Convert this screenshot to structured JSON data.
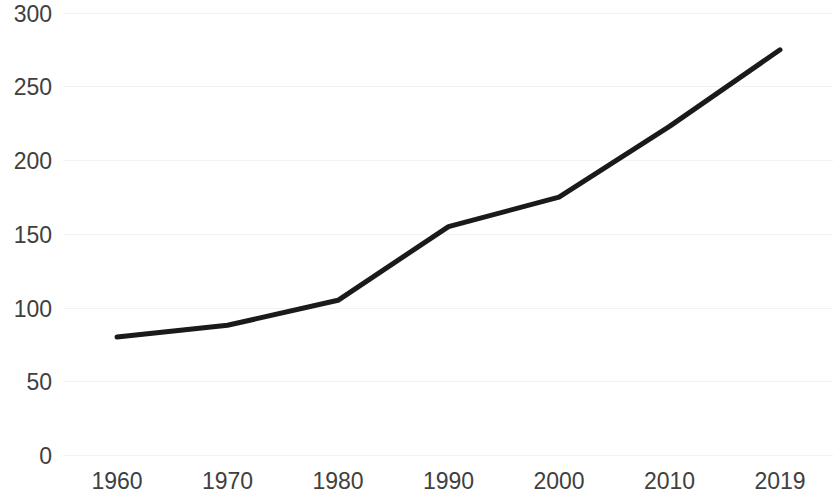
{
  "chart_data": {
    "type": "line",
    "title": "",
    "subtitle": "",
    "xlabel": "",
    "ylabel": "",
    "categories": [
      "1960",
      "1970",
      "1980",
      "1990",
      "2000",
      "2010",
      "2019"
    ],
    "x": [
      1960,
      1970,
      1980,
      1990,
      2000,
      2010,
      2019
    ],
    "values": [
      80,
      88,
      105,
      155,
      175,
      223,
      275
    ],
    "series": [
      {
        "name": "",
        "values": [
          80,
          88,
          105,
          155,
          175,
          223,
          275
        ],
        "color": "#1a1a1a",
        "line_width": 5
      }
    ],
    "ylim": [
      0,
      300
    ],
    "yticks": [
      0,
      50,
      100,
      150,
      200,
      250,
      300
    ],
    "ytick_labels": [
      "0",
      "50",
      "100",
      "150",
      "200",
      "250",
      "300"
    ],
    "xtick_labels": [
      "1960",
      "1970",
      "1980",
      "1990",
      "2000",
      "2010",
      "2019"
    ],
    "grid": true,
    "grid_axis": "y",
    "grid_color": "#f2f2f2",
    "legend": false,
    "legend_position": "none",
    "background": "#ffffff",
    "tick_label_color": "#404040",
    "annotations": []
  }
}
